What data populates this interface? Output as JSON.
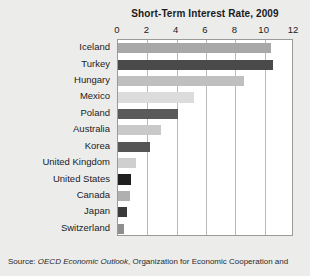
{
  "figure": {
    "background_color": "#ececeb",
    "plot_background_color": "#ffffff",
    "frame_color": "#9a9a9a",
    "gridline_color": "#b9b9b9"
  },
  "source": {
    "prefix": "Source: ",
    "italic_part": "OECD Economic Outlook",
    "rest": ", Organization for Economic Cooperation and",
    "full_text": "Source: OECD Economic Outlook, Organization for Economic Cooperation and"
  },
  "chart_data": {
    "type": "bar",
    "orientation": "horizontal",
    "title": "Short-Term Interest Rate, 2009",
    "xlabel": "",
    "ylabel": "",
    "xlim": [
      0,
      12
    ],
    "xticks": [
      0,
      2,
      4,
      6,
      8,
      10,
      12
    ],
    "xtick_labels": [
      "0",
      "2",
      "4",
      "6",
      "8",
      "10",
      "12"
    ],
    "axis_position": "top",
    "grid": true,
    "grid_axis": "x",
    "legend": false,
    "categories": [
      "Iceland",
      "Turkey",
      "Hungary",
      "Mexico",
      "Poland",
      "Australia",
      "Korea",
      "United Kingdom",
      "United States",
      "Canada",
      "Japan",
      "Switzerland"
    ],
    "values": [
      10.4,
      10.6,
      8.6,
      5.2,
      4.1,
      2.9,
      2.2,
      1.2,
      0.9,
      0.8,
      0.6,
      0.4
    ],
    "bar_colors": [
      "#a8a8a8",
      "#4a4a4a",
      "#bfbfbf",
      "#dcdcdc",
      "#5a5a5a",
      "#c9c9c9",
      "#555555",
      "#cfcfcf",
      "#1f1f1f",
      "#b0b0b0",
      "#3a3a3a",
      "#8f8f8f"
    ]
  }
}
